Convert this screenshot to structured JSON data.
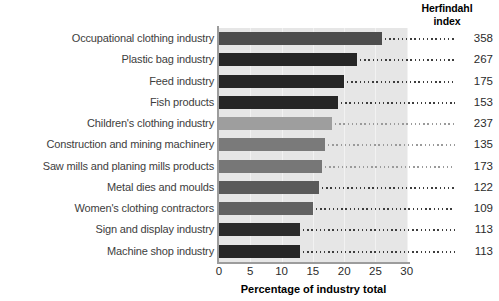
{
  "chart_data": {
    "type": "bar",
    "orientation": "horizontal",
    "title": "",
    "xlabel": "Percentage of industry total",
    "ylabel": "",
    "xlim": [
      0,
      30.2
    ],
    "xticks": [
      0,
      5,
      10,
      15,
      20,
      25,
      30
    ],
    "grid": true,
    "grid_axis": "x",
    "legend": "none",
    "categories": [
      "Occupational clothing industry",
      "Plastic bag industry",
      "Feed industry",
      "Fish products",
      "Children's clothing industry",
      "Construction and mining machinery",
      "Saw mills and planing mills products",
      "Metal dies and moulds",
      "Women's clothing contractors",
      "Sign and display industry",
      "Machine shop industry"
    ],
    "values": [
      26.0,
      22.0,
      20.0,
      19.0,
      18.0,
      17.0,
      16.5,
      16.0,
      15.0,
      13.0,
      13.0
    ],
    "bar_colors": [
      "#4d4d4d",
      "#262626",
      "#262626",
      "#262626",
      "#9e9e9e",
      "#7a7a7a",
      "#777777",
      "#5a5a5a",
      "#616161",
      "#2b2b2b",
      "#262626"
    ],
    "annotation_header": "Herfindahl\nindex",
    "annotations": [
      358,
      267,
      175,
      153,
      237,
      135,
      173,
      122,
      109,
      113,
      113
    ],
    "plot_background": "#e6e6e6"
  },
  "header": {
    "line1": "Herfindahl",
    "line2": "index"
  },
  "axis": {
    "xlabel": "Percentage of industry total",
    "tick_0": "0",
    "tick_1": "5",
    "tick_2": "10",
    "tick_3": "15",
    "tick_4": "20",
    "tick_5": "25",
    "tick_6": "30"
  },
  "rows": [
    {
      "label": "Occupational clothing industry",
      "value": 26.0,
      "hf": "358"
    },
    {
      "label": "Plastic bag industry",
      "value": 22.0,
      "hf": "267"
    },
    {
      "label": "Feed industry",
      "value": 20.0,
      "hf": "175"
    },
    {
      "label": "Fish products",
      "value": 19.0,
      "hf": "153"
    },
    {
      "label": "Children's clothing industry",
      "value": 18.0,
      "hf": "237"
    },
    {
      "label": "Construction and mining machinery",
      "value": 17.0,
      "hf": "135"
    },
    {
      "label": "Saw mills and planing mills products",
      "value": 16.5,
      "hf": "173"
    },
    {
      "label": "Metal dies and moulds",
      "value": 16.0,
      "hf": "122"
    },
    {
      "label": "Women's clothing contractors",
      "value": 15.0,
      "hf": "109"
    },
    {
      "label": "Sign and display industry",
      "value": 13.0,
      "hf": "113"
    },
    {
      "label": "Machine shop industry",
      "value": 13.0,
      "hf": "113"
    }
  ]
}
